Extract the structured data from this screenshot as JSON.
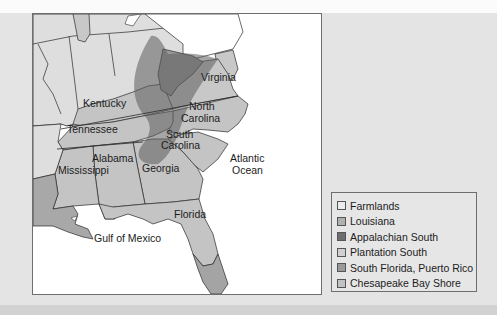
{
  "map": {
    "labels": {
      "virginia": "Virginia",
      "kentucky": "Kentucky",
      "north": "North",
      "carolina_n": "Carolina",
      "tennessee": "Tennessee",
      "south": "South",
      "carolina_s": "Carolina",
      "alabama": "Alabama",
      "mississippi": "Mississippi",
      "georgia": "Georgia",
      "florida": "Florida",
      "atlantic": "Atlantic",
      "ocean": "Ocean",
      "gulf": "Gulf of Mexico"
    },
    "colors": {
      "ocean": "#ffffff",
      "farmlands": "#dedede",
      "louisiana": "#a8a8a8",
      "appalachian": "#7a7a7a",
      "plantation": "#c4c4c4",
      "south_florida": "#a4a4a4",
      "chesapeake": "#c8c8c8",
      "border": "#2a2a2a"
    }
  },
  "legend": {
    "items": [
      {
        "label": "Farmlands",
        "color": "#ececec"
      },
      {
        "label": "Louisiana",
        "color": "#b0b0b0"
      },
      {
        "label": "Appalachian South",
        "color": "#6f6f6f"
      },
      {
        "label": "Plantation South",
        "color": "#d0d0d0"
      },
      {
        "label": "South Florida, Puerto Rico",
        "color": "#9a9a9a"
      },
      {
        "label": "Chesapeake Bay Shore",
        "color": "#c2c2c2"
      }
    ]
  }
}
